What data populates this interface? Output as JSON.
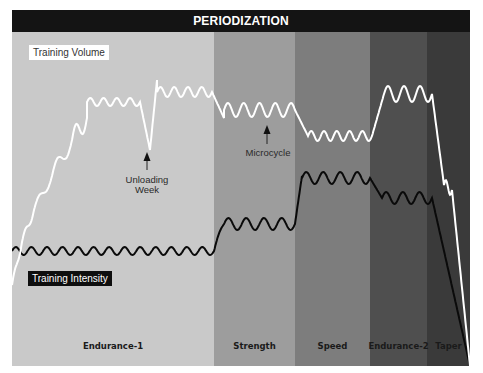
{
  "header": {
    "title": "PERIODIZATION"
  },
  "legend": {
    "volume_label": "Training Volume",
    "intensity_label": "Training Intensity"
  },
  "annotations": {
    "unloading": {
      "line1": "Unloading",
      "line2": "Week"
    },
    "microcycle": {
      "label": "Microcycle"
    }
  },
  "phases": [
    {
      "name": "Endurance-1",
      "x0": 0,
      "x1": 202,
      "color": "#c9c9c9"
    },
    {
      "name": "Strength",
      "x0": 202,
      "x1": 283,
      "color": "#9d9d9d"
    },
    {
      "name": "Speed",
      "x0": 283,
      "x1": 358,
      "color": "#7d7d7d"
    },
    {
      "name": "Endurance-2",
      "x0": 358,
      "x1": 415,
      "color": "#4f4f4f"
    },
    {
      "name": "Taper",
      "x0": 415,
      "x1": 458,
      "color": "#3a3a3a"
    }
  ],
  "colors": {
    "header_bg": "#141414",
    "volume_line": "#ffffff",
    "intensity_line": "#0a0a0a"
  },
  "chart_data": {
    "type": "line",
    "title": "PERIODIZATION",
    "xlabel": "",
    "ylabel": "",
    "grid": false,
    "categories": [
      "Endurance-1",
      "Strength",
      "Speed",
      "Endurance-2",
      "Taper"
    ],
    "series": [
      {
        "name": "Training Volume",
        "description": "Stepwise increase through Endurance-1 with an unloading-week dip, slightly lower plateau with microcycle oscillations in Strength, lower in Speed, peak in Endurance-2, steep drop in Taper",
        "relative_levels": {
          "Endurance-1_start": 0.05,
          "Endurance-1_plateau1": 0.72,
          "unloading_week": 0.48,
          "Endurance-1_plateau2": 0.8,
          "Strength": 0.66,
          "Speed": 0.6,
          "Endurance-2": 0.8,
          "Taper_end": 0.0
        }
      },
      {
        "name": "Training Intensity",
        "description": "Low constant oscillating through Endurance-1, step up in Strength, high in Speed, moderately lower in Endurance-2, drops to zero during Taper",
        "relative_levels": {
          "Endurance-1": 0.33,
          "Strength": 0.42,
          "Speed": 0.6,
          "Endurance-2": 0.53,
          "Taper_end": 0.0
        }
      }
    ]
  }
}
